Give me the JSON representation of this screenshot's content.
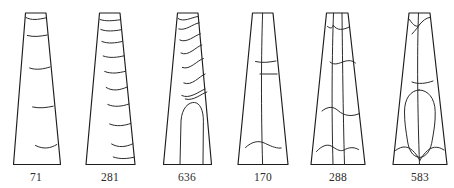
{
  "plate": {
    "name": "tapered-artifact-line-drawings",
    "background_color": "#ffffff",
    "stroke_color": "#1d1d1d",
    "inner_stroke_color": "#2a2a2a",
    "label_color": "#2b2b2b",
    "figure_count": 6
  },
  "figures": [
    {
      "label": "71",
      "label_x": 36,
      "label_y": 181,
      "decoration": "horizontal-bands",
      "band_count": 5,
      "outline": "M 25.5,13.0 L 46.0,13.0 L 60.5,164.5 L 13.5,164.5 Z",
      "inner_paths": [
        "M 25.9,17.5 C 31.5,20.6 38.0,19.6 45.6,17.9",
        "M 27.3,35.5 C 34.0,37.2 40.0,36.4 47.2,35.0",
        "M 29.6,68.0 C 36.5,70.4 43.5,69.0 50.0,67.0",
        "M 32.6,107.0 C 40.0,108.6 46.5,107.6 53.2,106.2",
        "M 35.5,145.5 C 43.5,149.6 50.5,148.4 56.8,144.5"
      ]
    },
    {
      "label": "281",
      "label_x": 110,
      "label_y": 181,
      "decoration": "horizontal-bands-dense",
      "band_count": 9,
      "outline": "M 99.5,13.0 L 120.0,13.0 L 135.0,164.5 L 86.0,164.5 Z",
      "inner_paths": [
        "M 99.9,19.5 C 105.5,21.5 113.0,20.8 119.9,19.8",
        "M 100.8,29.5 C 107.0,31.8 114.0,31.0 121.0,29.8",
        "M 101.9,41.5 C 108.5,44.0 115.5,43.0 122.2,41.5",
        "M 103.2,56.0 C 110.0,58.4 117.5,57.4 124.0,55.8",
        "M 104.7,71.5 C 111.5,74.2 119.0,73.0 125.6,71.2",
        "M 106.2,87.5 C 112.5,91.5 120.0,90.2 127.2,87.0",
        "M 107.8,104.5 C 114.5,107.5 122.0,106.4 128.9,104.0",
        "M 109.6,124.0 C 116.5,126.8 124.0,125.8 130.7,123.5",
        "M 111.6,144.0 C 118.5,148.0 126.0,147.0 132.8,143.8",
        "M 113.3,157.0 C 120.5,159.5 127.5,158.6 134.3,157.2"
      ]
    },
    {
      "label": "636",
      "label_x": 187,
      "label_y": 181,
      "decoration": "diagonal-bands-with-arch",
      "band_count": 7,
      "outline": "M 177.5,13.0 L 198.0,13.0 L 211.5,164.5 L 163.5,164.5 Z",
      "inner_paths": [
        "M 178.0,18.5 C 184.0,22.5 191.0,17.5 197.9,16.5",
        "M 178.8,29.0 C 186.0,31.0 192.5,24.0 199.1,22.8",
        "M 179.8,40.0 C 187.0,43.5 194.5,35.5 200.3,33.8",
        "M 181.0,53.0 C 188.5,57.0 196.0,46.5 201.8,45.0",
        "M 182.3,67.5 C 190.0,70.5 197.5,60.0 203.4,58.5",
        "M 183.8,83.0 C 192.0,86.5 199.5,76.0 205.1,74.0",
        "M 185.3,99.0 C 193.5,101.5 201.5,93.5 206.8,92.0",
        "M 181.8,95.5 C 189.5,99.5 199.0,91.5 205.0,89.0"
      ],
      "arch_path": "M 180.0,164.0 L 181.0,121.0 C 181.8,107.5 189.0,102.0 194.5,102.5 C 199.8,103.0 203.5,110.0 203.4,121.5 L 203.0,164.0"
    },
    {
      "label": "170",
      "label_x": 263,
      "label_y": 181,
      "decoration": "center-vertical-with-two-cross-bands",
      "band_count": 2,
      "outline": "M 252.5,13.0 L 273.0,13.0 L 288.0,164.5 L 238.0,164.5 Z",
      "inner_paths": [
        "M 262.6,13.2 C 261.2,55.0 261.0,110.0 262.6,164.3",
        "M 255.5,61.5 C 262.5,63.2 269.0,62.2 276.0,61.0",
        "M 260.0,74.0 L 277.2,74.0",
        "M 245.5,147.5 C 252.0,141.5 258.5,140.0 265.5,143.5 C 272.5,147.0 277.5,148.6 281.2,148.0"
      ]
    },
    {
      "label": "288",
      "label_x": 338,
      "label_y": 181,
      "decoration": "split-panels-with-curved-bands",
      "band_count": 4,
      "outline": "M 326.5,13.0 L 348.0,13.0 L 365.0,164.5 L 311.0,164.5 Z",
      "inner_paths": [
        "M 333.5,13.2 C 332.0,55.0 331.5,110.0 333.0,164.3",
        "M 342.0,13.2 C 342.5,55.0 343.0,110.0 344.5,164.3",
        "M 327.5,26.5 C 330.0,28.5 332.0,28.8 333.3,25.5",
        "M 333.3,25.5 C 337.5,31.0 343.0,30.0 349.2,27.0",
        "M 330.0,62.0 C 334.5,66.0 339.5,63.0 344.0,61.5 C 349.0,60.0 352.5,60.5 355.5,63.0",
        "M 322.0,111.0 C 327.5,106.5 333.0,106.0 338.0,110.5 C 344.0,116.0 352.0,117.0 359.5,113.5",
        "M 316.5,151.5 C 322.5,145.0 328.0,143.5 333.0,147.0 C 337.5,150.2 341.0,151.5 344.0,150.0 C 348.5,147.5 353.5,146.5 358.5,149.5"
      ]
    },
    {
      "label": "583",
      "label_x": 420,
      "label_y": 181,
      "decoration": "large-central-blob-with-upper-bands",
      "band_count": 3,
      "outline": "M 409.0,13.0 L 430.0,13.0 L 447.0,164.5 L 393.0,164.5 Z",
      "inner_paths": [
        "M 418.5,13.2 C 417.0,55.0 417.5,110.0 419.5,164.3",
        "M 409.5,19.5 C 413.5,26.0 417.0,27.5 419.2,25.0 C 423.0,20.5 426.0,18.0 429.6,17.5",
        "M 412.0,34.0 C 415.5,30.0 418.0,27.5 419.2,25.0",
        "M 412.0,82.0 C 418.5,84.5 426.0,83.5 433.0,81.0",
        "M 395.5,150.5 C 402.5,145.0 409.0,146.0 414.5,152.5 C 417.5,156.0 419.0,158.5 419.8,160.5",
        "M 444.0,150.0 C 437.5,145.5 431.0,146.5 425.5,152.5 C 422.5,156.0 420.8,158.5 419.8,160.5"
      ],
      "blob_path": "M 419.0,90.0 C 410.5,90.5 404.5,98.5 404.5,112.0 C 404.5,123.0 406.0,131.0 407.5,141.0 C 408.8,149.5 412.0,156.5 419.6,157.5 C 427.5,156.5 430.8,149.0 432.2,140.5 C 434.0,130.0 435.5,122.0 435.2,111.5 C 434.8,98.0 428.0,90.0 419.0,90.0 Z"
    }
  ]
}
